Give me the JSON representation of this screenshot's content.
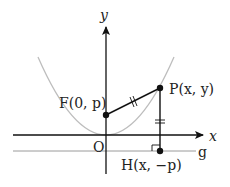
{
  "diagram": {
    "axes": {
      "x_label": "x",
      "y_label": "y",
      "origin_label": "O"
    },
    "directrix": {
      "label": "g"
    },
    "points": {
      "focus": {
        "name": "F",
        "coords": "(0, p)"
      },
      "point_on_curve": {
        "name": "P",
        "coords": "(x, y)"
      },
      "foot": {
        "name": "H",
        "coords": "(x, −p)"
      }
    },
    "marks": {
      "equal_length_marks": "PF = PH",
      "right_angle_at": "H"
    },
    "colors": {
      "axis": "#111111",
      "parabola": "#b8b8b8",
      "segment": "#111111",
      "directrix": "#9a9a9a"
    }
  }
}
